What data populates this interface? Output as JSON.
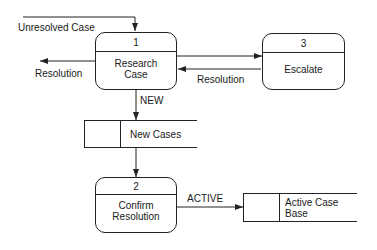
{
  "diagram": {
    "type": "data-flow-diagram",
    "processes": [
      {
        "id": "1",
        "number": "1",
        "name_line1": "Research",
        "name_line2": "Case"
      },
      {
        "id": "2",
        "number": "2",
        "name_line1": "Confirm",
        "name_line2": "Resolution"
      },
      {
        "id": "3",
        "number": "3",
        "name_line1": "Escalate",
        "name_line2": ""
      }
    ],
    "data_stores": [
      {
        "id": "new-cases",
        "name": "New Cases"
      },
      {
        "id": "active-case-base",
        "name": "Active Case Base"
      }
    ],
    "flows": [
      {
        "label": "Unresolved Case",
        "from": "external",
        "to": "1"
      },
      {
        "label": "Resolution",
        "from": "1",
        "to": "external"
      },
      {
        "label": "",
        "from": "1",
        "to": "3"
      },
      {
        "label": "Resolution",
        "from": "3",
        "to": "1"
      },
      {
        "label": "NEW",
        "from": "1",
        "to": "New Cases"
      },
      {
        "label": "",
        "from": "New Cases",
        "to": "2"
      },
      {
        "label": "ACTIVE",
        "from": "2",
        "to": "Active Case Base"
      }
    ],
    "labels": {
      "unresolved_case": "Unresolved Case",
      "resolution_out": "Resolution",
      "resolution_back": "Resolution",
      "new": "NEW",
      "active": "ACTIVE"
    },
    "colors": {
      "line": "#222222",
      "background": "#ffffff",
      "text": "#1a1a1a"
    }
  }
}
